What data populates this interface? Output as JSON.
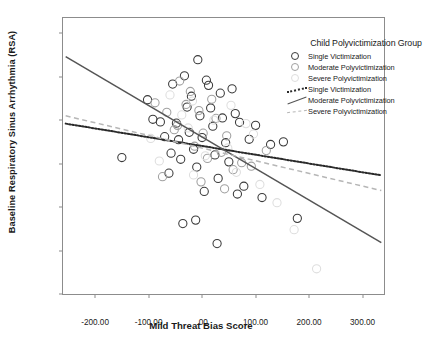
{
  "chart_data": {
    "type": "scatter",
    "title": "",
    "xlabel": "Mild Threat Bias Score",
    "ylabel": "Baseline Respiratory Sinus Arrhythmia (RSA)",
    "xlim": [
      -260,
      340
    ],
    "ylim": [
      3.0,
      9.35
    ],
    "grid": false,
    "legend_position": "top-right",
    "xticks": [
      -200,
      -100,
      0,
      100,
      200,
      300
    ],
    "xticklabels": [
      "-200.00",
      "-100.00",
      ".00",
      "100.00",
      "200.00",
      "300.00"
    ],
    "yticks": [
      3.0,
      4.0,
      5.0,
      6.0,
      7.0,
      8.0,
      9.0
    ],
    "yticklabels": [
      "3.0000",
      "4.0000",
      "5.0000",
      "6.0000",
      "7.0000",
      "8.0000",
      "9.0000"
    ],
    "legend_title": "Child Polyvictimization Group",
    "colors": {
      "single": "#3a3a3a",
      "moderate": "#a0a0a0",
      "severe": "#dedede"
    },
    "series": [
      {
        "name": "Single Victimization",
        "marker": "open-circle",
        "color": "#3a3a3a",
        "points": [
          [
            -150,
            6.14
          ],
          [
            -102,
            7.47
          ],
          [
            -92,
            7.02
          ],
          [
            -78,
            6.96
          ],
          [
            -70,
            6.62
          ],
          [
            -62,
            5.78
          ],
          [
            -55,
            7.83
          ],
          [
            -48,
            6.93
          ],
          [
            -44,
            6.55
          ],
          [
            -40,
            6.1
          ],
          [
            -33,
            8.02
          ],
          [
            -28,
            7.3
          ],
          [
            -24,
            6.72
          ],
          [
            -20,
            7.55
          ],
          [
            -16,
            6.33
          ],
          [
            -12,
            4.7
          ],
          [
            -8,
            8.39
          ],
          [
            -4,
            7.1
          ],
          [
            0,
            6.6
          ],
          [
            4,
            5.36
          ],
          [
            8,
            7.92
          ],
          [
            12,
            7.8
          ],
          [
            16,
            7.28
          ],
          [
            20,
            6.86
          ],
          [
            24,
            6.2
          ],
          [
            28,
            4.16
          ],
          [
            34,
            7.62
          ],
          [
            38,
            7.05
          ],
          [
            44,
            6.48
          ],
          [
            50,
            6.04
          ],
          [
            56,
            7.72
          ],
          [
            62,
            7.15
          ],
          [
            70,
            6.95
          ],
          [
            78,
            5.48
          ],
          [
            88,
            6.56
          ],
          [
            100,
            6.88
          ],
          [
            112,
            5.22
          ],
          [
            128,
            6.44
          ],
          [
            152,
            6.5
          ],
          [
            178,
            4.74
          ],
          [
            -58,
            6.24
          ],
          [
            -10,
            5.92
          ],
          [
            30,
            5.66
          ],
          [
            66,
            5.3
          ],
          [
            -36,
            4.62
          ]
        ]
      },
      {
        "name": "Moderate Polyvictimization",
        "marker": "open-circle",
        "color": "#a0a0a0",
        "points": [
          [
            -88,
            7.4
          ],
          [
            -66,
            7.18
          ],
          [
            -52,
            6.78
          ],
          [
            -42,
            7.9
          ],
          [
            -30,
            7.36
          ],
          [
            -22,
            7.66
          ],
          [
            -14,
            6.4
          ],
          [
            -6,
            7.22
          ],
          [
            2,
            6.7
          ],
          [
            10,
            6.12
          ],
          [
            18,
            7.48
          ],
          [
            26,
            7.04
          ],
          [
            36,
            6.26
          ],
          [
            46,
            6.64
          ],
          [
            58,
            5.86
          ],
          [
            74,
            6.02
          ],
          [
            92,
            5.94
          ],
          [
            -74,
            5.7
          ],
          [
            -2,
            5.58
          ],
          [
            42,
            5.42
          ],
          [
            120,
            6.3
          ],
          [
            -46,
            6.88
          ]
        ]
      },
      {
        "name": "Severe Polyvictimization",
        "marker": "open-circle",
        "color": "#dedede",
        "points": [
          [
            -96,
            6.58
          ],
          [
            -60,
            7.58
          ],
          [
            -38,
            7.12
          ],
          [
            -26,
            6.82
          ],
          [
            -18,
            7.44
          ],
          [
            6,
            6.18
          ],
          [
            22,
            7.0
          ],
          [
            48,
            6.36
          ],
          [
            64,
            5.8
          ],
          [
            96,
            6.68
          ],
          [
            108,
            5.52
          ],
          [
            140,
            5.1
          ],
          [
            172,
            4.48
          ],
          [
            214,
            3.58
          ],
          [
            -80,
            6.06
          ],
          [
            -16,
            5.74
          ],
          [
            82,
            6.92
          ],
          [
            54,
            7.34
          ]
        ]
      }
    ],
    "fit_lines": [
      {
        "name": "Single Victimization",
        "style": "dotted",
        "color": "#2a2a2a",
        "x": [
          -255,
          335
        ],
        "y": [
          6.92,
          5.73
        ]
      },
      {
        "name": "Moderate Polyvictimization",
        "style": "solid",
        "color": "#555555",
        "x": [
          -255,
          335
        ],
        "y": [
          8.46,
          4.18
        ]
      },
      {
        "name": "Severe Polyvictimization",
        "style": "dashed",
        "color": "#b6b6b6",
        "x": [
          -255,
          335
        ],
        "y": [
          7.1,
          5.38
        ]
      }
    ]
  },
  "legend": {
    "title": "Child Polyvictimization Group",
    "marker_entries": [
      {
        "label": "Single Victimization"
      },
      {
        "label": "Moderate Polyvictimization"
      },
      {
        "label": "Severe Polyvictimization"
      }
    ],
    "line_entries": [
      {
        "label": "Single Victimization"
      },
      {
        "label": "Moderate Polyvictimization"
      },
      {
        "label": "Severe Polyvictimization"
      }
    ]
  }
}
